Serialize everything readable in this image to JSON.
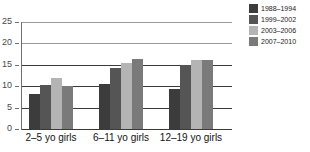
{
  "chart_data": {
    "type": "bar",
    "title": "",
    "subtitle": "",
    "xlabel": "",
    "ylabel": "",
    "ylim": [
      0,
      25
    ],
    "yticks": [
      0,
      5,
      10,
      15,
      20,
      25
    ],
    "ytick_labels": [
      "0",
      "5",
      "10",
      "15",
      "20",
      "25"
    ],
    "grid": true,
    "grid_axis": "y",
    "legend_position": "right",
    "categories": [
      "2–5 yo girls",
      "6–11 yo girls",
      "12–19 yo girls"
    ],
    "series": [
      {
        "name": "1988–1994",
        "color": "#3c3c3c",
        "values": [
          8.1,
          10.6,
          9.4
        ]
      },
      {
        "name": "1999–2002",
        "color": "#555555",
        "values": [
          10.4,
          14.3,
          15.0
        ]
      },
      {
        "name": "2003–2006",
        "color": "#b4b4b4",
        "values": [
          12.0,
          15.4,
          16.2
        ]
      },
      {
        "name": "2007–2010",
        "color": "#7a7a7a",
        "values": [
          10.1,
          16.3,
          16.2
        ]
      }
    ]
  },
  "axes": {
    "y": {
      "tick_labels": [
        "25",
        "20",
        "15",
        "10",
        "5",
        "0"
      ]
    },
    "x": {
      "tick_labels": [
        "2–5 yo girls",
        "6–11 yo girls",
        "12–19 yo girls"
      ]
    }
  },
  "legend": {
    "items": [
      {
        "label": "1988–1994",
        "color": "#3c3c3c"
      },
      {
        "label": "1999–2002",
        "color": "#555555"
      },
      {
        "label": "2003–2006",
        "color": "#b4b4b4"
      },
      {
        "label": "2007–2010",
        "color": "#7a7a7a"
      }
    ]
  },
  "colors": {
    "gridline": "#3a3a3a",
    "gridline_faint": "#9a9a9a",
    "axis": "#6f6f6f",
    "tick_text": "#4a4a4a",
    "category_text": "#111111",
    "background": "#ffffff"
  }
}
